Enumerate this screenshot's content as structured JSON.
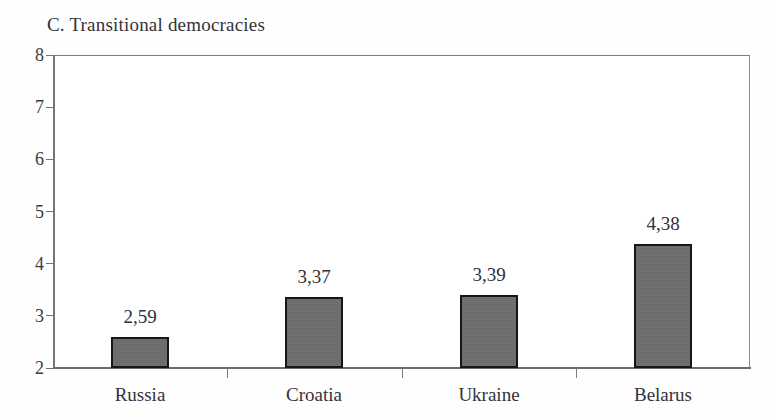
{
  "chart_data": {
    "type": "bar",
    "title": "C. Transitional democracies",
    "xlabel": "",
    "ylabel": "",
    "categories": [
      "Russia",
      "Croatia",
      "Ukraine",
      "Belarus"
    ],
    "values": [
      2.59,
      3.37,
      3.39,
      4.38
    ],
    "value_labels": [
      "2,59",
      "3,37",
      "3,39",
      "4,38"
    ],
    "decimal_separator": ",",
    "ylim": [
      2,
      8
    ],
    "yticks": [
      2,
      3,
      4,
      5,
      6,
      7,
      8
    ],
    "ytick_labels": [
      "2",
      "3",
      "4",
      "5",
      "6",
      "7",
      "8"
    ],
    "grid": false,
    "legend": null,
    "bar_color": "#6d6d6d",
    "bar_edge_color": "#171717",
    "background_color": "#ffffff",
    "frame_color": "#8d8d92",
    "text_color": "#33333a"
  }
}
